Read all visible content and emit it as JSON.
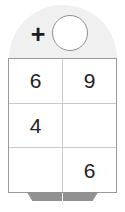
{
  "puzzle": {
    "type": "addition-grid-puzzle",
    "operator": "+",
    "answer_circle": {
      "value": "",
      "filled": false
    },
    "grid": {
      "rows": 3,
      "columns": 2,
      "cells": [
        [
          {
            "value": "6",
            "empty": false
          },
          {
            "value": "9",
            "empty": false
          }
        ],
        [
          {
            "value": "4",
            "empty": false
          },
          {
            "value": "",
            "empty": true
          }
        ],
        [
          {
            "value": "",
            "empty": true
          },
          {
            "value": "6",
            "empty": false
          }
        ]
      ]
    },
    "feet": [
      {
        "name": "foot-left"
      },
      {
        "name": "foot-right"
      }
    ]
  },
  "colors": {
    "dome_fill": "#f0f0f0",
    "grid_border": "#9a9a9a",
    "grid_inner_line": "#c9c9c9",
    "circle_stroke": "#8f8f8f",
    "digit_color": "#222222",
    "operator_color": "#1e1e1e",
    "foot_fill": "#919191",
    "background": "#ffffff"
  }
}
